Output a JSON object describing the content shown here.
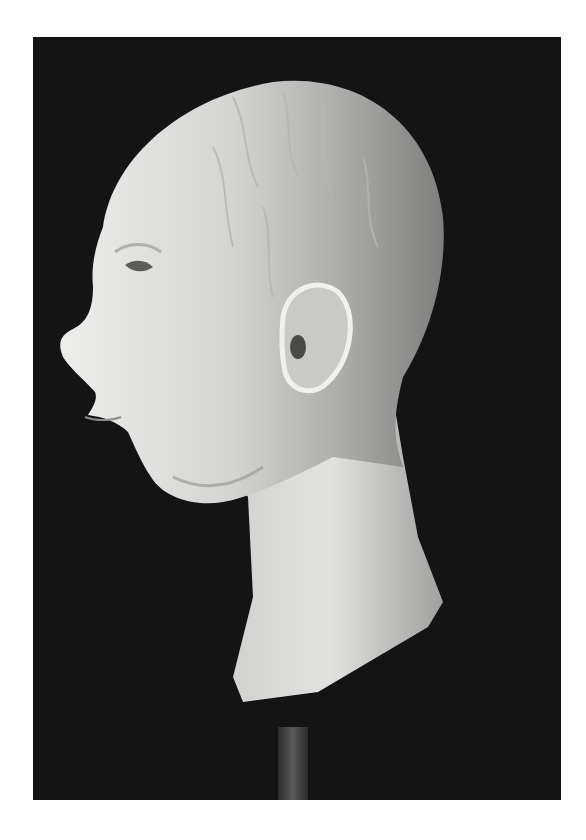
{
  "image": {
    "subject": "Clay sculpture of a human head in left-facing profile on a stand",
    "alt": "Grayscale photograph of a sculpted clay head, bald, shown in profile facing left, with visible ear and neck, mounted on a dark rod against a black background",
    "colors": {
      "page_background": "#ffffff",
      "photo_background": "#141414",
      "clay_light": "#e8e8e6",
      "clay_mid": "#bdbdbb",
      "clay_shadow": "#8a8a88",
      "rod": "#4a4a4a"
    }
  }
}
